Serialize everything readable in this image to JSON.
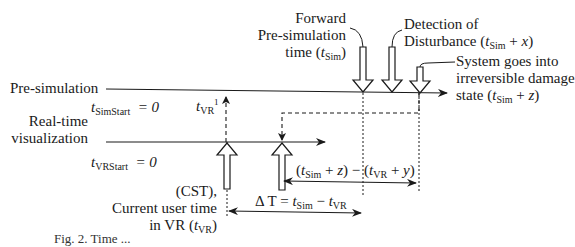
{
  "timelines": {
    "pre_simulation": {
      "label": "Pre-simulation",
      "start_label": "t_SimStart = 0",
      "start_var": "t",
      "start_sub": "SimStart",
      "start_eq": "= 0"
    },
    "real_time": {
      "label_line1": "Real-time",
      "label_line2": "visualization",
      "start_var": "t",
      "start_sub": "VRStart",
      "start_eq": "= 0"
    }
  },
  "annotations": {
    "forward": {
      "line1": "Forward",
      "line2": "Pre-simulation",
      "line3_pre": "time (",
      "var": "t",
      "sub": "Sim",
      "line3_post": ")"
    },
    "detection": {
      "line1": "Detection of",
      "line2_pre": "Disturbance (",
      "var": "t",
      "sub": "Sim",
      "line2_post": " + x)",
      "x": "x"
    },
    "damage": {
      "line1": "System goes into",
      "line2": "irreversible damage",
      "line3_pre": "state (",
      "var": "t",
      "sub": "Sim",
      "line3_mid": " + ",
      "z": "z",
      "line3_post": ")"
    },
    "tvr_marker": {
      "var": "t",
      "sub": "VR",
      "sup": "1"
    },
    "cst": {
      "line1": "(CST),",
      "line2": "Current user time",
      "line3_pre": "in VR (",
      "var": "t",
      "sub": "VR",
      "line3_post": ")"
    },
    "delta_t": {
      "pre": "Δ T = ",
      "var1": "t",
      "sub1": "Sim",
      "mid": " −  ",
      "var2": "t",
      "sub2": "VR"
    },
    "margin": {
      "open1": "(",
      "var1": "t",
      "sub1": "Sim",
      "plus1": " + ",
      "z": "z",
      "mid": ") − (",
      "var2": "t",
      "sub2": "VR",
      "plus2": " + ",
      "y": "y",
      "close": ")"
    }
  },
  "caption": "Fig. 2. Time ..."
}
